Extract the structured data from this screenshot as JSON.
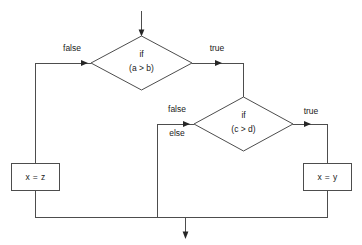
{
  "diagram": {
    "type": "flowchart",
    "background_color": "#ffffff",
    "line_color": "#4d4d4d",
    "text_color": "#1a1a1a",
    "nodes": [
      {
        "id": "decision1",
        "shape": "diamond",
        "line1": "if",
        "line2": "(a > b)"
      },
      {
        "id": "decision2",
        "shape": "diamond",
        "line1": "if",
        "line2": "(c > d)"
      },
      {
        "id": "process_left",
        "shape": "rectangle",
        "text": "x = z"
      },
      {
        "id": "process_right",
        "shape": "rectangle",
        "text": "x = y"
      }
    ],
    "edge_labels": {
      "decision1_false": "false",
      "decision1_true": "true",
      "decision2_false": "false",
      "decision2_else": "else",
      "decision2_true": "true"
    }
  }
}
